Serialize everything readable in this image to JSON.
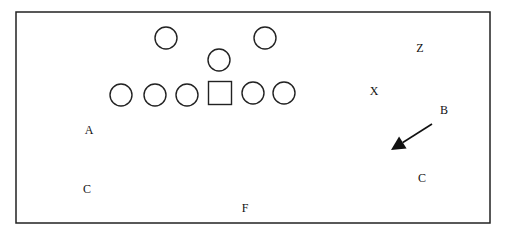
{
  "diagram": {
    "type": "football-formation",
    "offense_players": [
      {
        "shape": "circle",
        "cx": 166,
        "cy": 38
      },
      {
        "shape": "circle",
        "cx": 265,
        "cy": 38
      },
      {
        "shape": "circle",
        "cx": 219,
        "cy": 60
      },
      {
        "shape": "circle",
        "cx": 121,
        "cy": 95
      },
      {
        "shape": "circle",
        "cx": 155,
        "cy": 95
      },
      {
        "shape": "circle",
        "cx": 187,
        "cy": 95
      },
      {
        "shape": "square",
        "cx": 220,
        "cy": 93
      },
      {
        "shape": "circle",
        "cx": 253,
        "cy": 93
      },
      {
        "shape": "circle",
        "cx": 284,
        "cy": 93
      }
    ],
    "labels": [
      {
        "text": "Z",
        "x": 420,
        "y": 52
      },
      {
        "text": "X",
        "x": 374,
        "y": 95
      },
      {
        "text": "B",
        "x": 444,
        "y": 114
      },
      {
        "text": "A",
        "x": 89,
        "y": 134
      },
      {
        "text": "C",
        "x": 87,
        "y": 193
      },
      {
        "text": "C",
        "x": 422,
        "y": 182
      },
      {
        "text": "F",
        "x": 245,
        "y": 212
      }
    ],
    "arrow": {
      "from": [
        432,
        124
      ],
      "to": [
        391,
        150
      ]
    }
  }
}
